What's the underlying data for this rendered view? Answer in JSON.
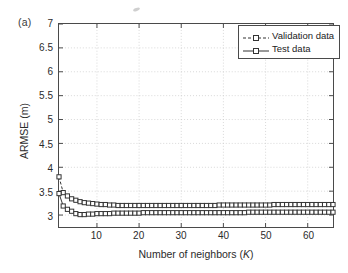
{
  "figure": {
    "panel_label": "(a)",
    "background_color": "#ffffff",
    "frame_color": "#4a4a4a"
  },
  "legend": {
    "position": "top-right",
    "border_color": "#4a4a4a",
    "entries": [
      {
        "label": "Validation data",
        "linestyle": "dashed",
        "marker": "open-square",
        "color": "#333333"
      },
      {
        "label": "Test data",
        "linestyle": "solid",
        "marker": "open-square",
        "color": "#333333"
      }
    ]
  },
  "chart_data": {
    "type": "line",
    "title": "",
    "xlabel": "Number of neighbors (K)",
    "ylabel": "ARMSE (m)",
    "xlim": [
      1,
      66
    ],
    "ylim": [
      2.75,
      7
    ],
    "xticks": [
      10,
      20,
      30,
      40,
      50,
      60
    ],
    "yticks": [
      3,
      3.5,
      4,
      4.5,
      5,
      5.5,
      6,
      6.5,
      7
    ],
    "ytick_labels": [
      "3",
      "3.5",
      "4",
      "4.5",
      "5",
      "5.5",
      "6",
      "6.5",
      "7"
    ],
    "xtick_labels": [
      "10",
      "20",
      "30",
      "40",
      "50",
      "60"
    ],
    "grid": true,
    "grid_style": "dotted",
    "legend_position": "top-right",
    "x": [
      1,
      2,
      3,
      4,
      5,
      6,
      7,
      8,
      9,
      10,
      11,
      12,
      13,
      14,
      15,
      16,
      17,
      18,
      19,
      20,
      21,
      22,
      23,
      24,
      25,
      26,
      27,
      28,
      29,
      30,
      31,
      32,
      33,
      34,
      35,
      36,
      37,
      38,
      39,
      40,
      41,
      42,
      43,
      44,
      45,
      46,
      47,
      48,
      49,
      50,
      51,
      52,
      53,
      54,
      55,
      56,
      57,
      58,
      59,
      60,
      61,
      62,
      63,
      64,
      65,
      66
    ],
    "series": [
      {
        "name": "Validation data",
        "values": [
          3.8,
          3.47,
          3.4,
          3.34,
          3.31,
          3.28,
          3.26,
          3.25,
          3.24,
          3.23,
          3.22,
          3.22,
          3.21,
          3.21,
          3.2,
          3.2,
          3.2,
          3.2,
          3.2,
          3.2,
          3.2,
          3.2,
          3.2,
          3.2,
          3.2,
          3.2,
          3.2,
          3.2,
          3.2,
          3.2,
          3.2,
          3.2,
          3.2,
          3.2,
          3.2,
          3.2,
          3.2,
          3.2,
          3.21,
          3.21,
          3.21,
          3.21,
          3.21,
          3.21,
          3.21,
          3.21,
          3.21,
          3.21,
          3.21,
          3.21,
          3.21,
          3.22,
          3.22,
          3.22,
          3.22,
          3.22,
          3.22,
          3.22,
          3.22,
          3.22,
          3.22,
          3.22,
          3.22,
          3.22,
          3.22,
          3.22
        ]
      },
      {
        "name": "Test data",
        "values": [
          3.45,
          3.19,
          3.12,
          3.08,
          3.03,
          3.01,
          3.01,
          3.02,
          3.02,
          3.03,
          3.03,
          3.03,
          3.03,
          3.04,
          3.04,
          3.04,
          3.04,
          3.04,
          3.04,
          3.04,
          3.05,
          3.05,
          3.05,
          3.05,
          3.05,
          3.05,
          3.05,
          3.05,
          3.05,
          3.05,
          3.05,
          3.05,
          3.05,
          3.05,
          3.05,
          3.05,
          3.05,
          3.05,
          3.05,
          3.05,
          3.05,
          3.05,
          3.05,
          3.05,
          3.05,
          3.06,
          3.06,
          3.06,
          3.06,
          3.06,
          3.06,
          3.06,
          3.06,
          3.06,
          3.06,
          3.06,
          3.06,
          3.06,
          3.06,
          3.06,
          3.06,
          3.06,
          3.06,
          3.06,
          3.06,
          3.06
        ]
      }
    ]
  }
}
